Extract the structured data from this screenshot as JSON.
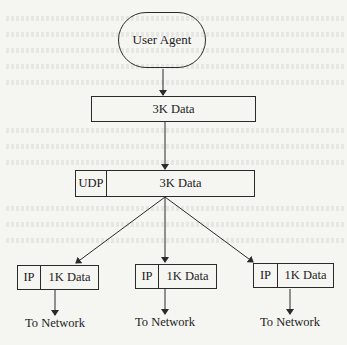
{
  "diagram": {
    "type": "flow",
    "source": {
      "label": "User Agent",
      "shape": "rounded-pill"
    },
    "app_data": {
      "label": "3K Data"
    },
    "udp_datagram": {
      "header": "UDP",
      "payload": "3K Data"
    },
    "ip_packets": [
      {
        "header": "IP",
        "payload": "1K Data",
        "destination": "To Network"
      },
      {
        "header": "IP",
        "payload": "1K Data",
        "destination": "To Network"
      },
      {
        "header": "IP",
        "payload": "1K Data",
        "destination": "To Network"
      }
    ],
    "colors": {
      "line": "#2a2a2a",
      "background": "#f5f5f2"
    }
  }
}
